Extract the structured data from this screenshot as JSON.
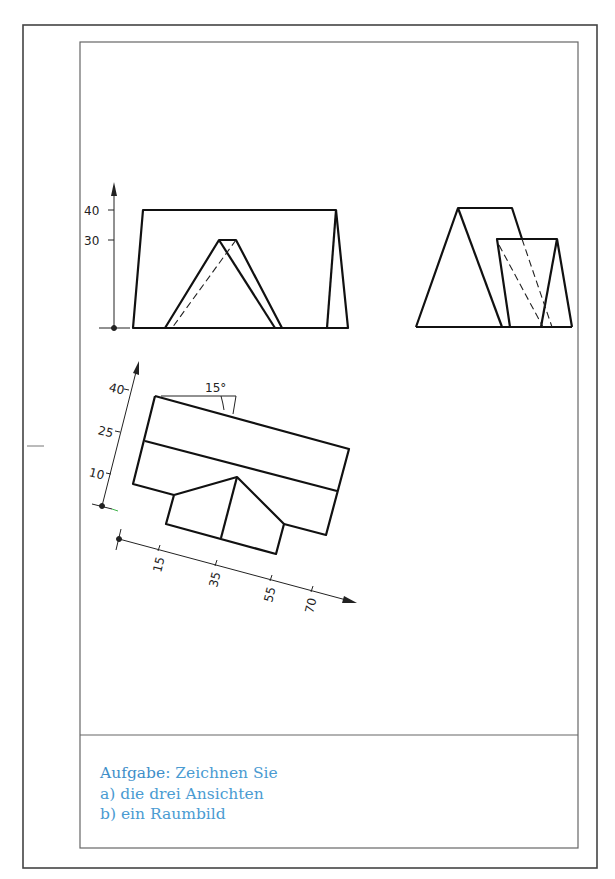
{
  "sheet": {
    "outer_border": {
      "x": 23,
      "y": 25,
      "w": 574,
      "h": 843
    },
    "inner_border": {
      "x": 80,
      "y": 42,
      "w": 498,
      "h": 806
    },
    "divider_y": 735,
    "margin_tick": {
      "x1": 27,
      "x2": 44,
      "y": 446
    }
  },
  "colors": {
    "line": "#111111",
    "frame": "#555555",
    "task_text": "#4a9bd2"
  },
  "front_view": {
    "axis_labels": [
      "40",
      "30"
    ],
    "dimension_axis": "vertical"
  },
  "side_view": {},
  "top_view_oblique": {
    "angle_label": "15°",
    "y_axis_labels": [
      "40",
      "25",
      "10"
    ],
    "x_axis_labels": [
      "15",
      "35",
      "55",
      "70"
    ]
  },
  "task": {
    "keyword": "Aufgabe",
    "separator": ":",
    "instruction": " Zeichnen Sie",
    "item_a": "a) die drei Ansichten",
    "item_b": "b) ein Raumbild"
  }
}
